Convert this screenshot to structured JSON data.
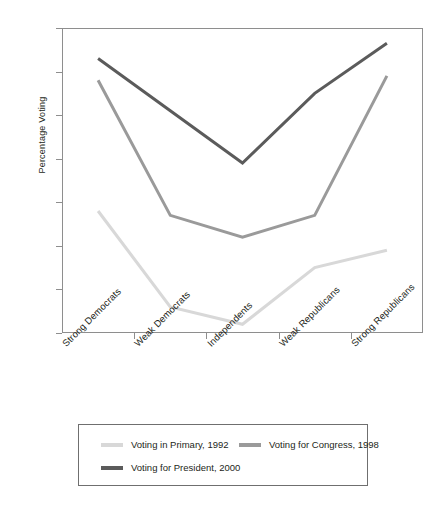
{
  "chart_data": {
    "type": "line",
    "title": "",
    "subtitle": "",
    "xlabel": "",
    "ylabel": "Percentage Voting",
    "categories": [
      "Strong Democrats",
      "Weak Democrats",
      "Independents",
      "Weak Republicans",
      "Strong Republicans"
    ],
    "ylim": [
      20,
      90
    ],
    "yticks": [
      20,
      30,
      40,
      50,
      60,
      70,
      80,
      90
    ],
    "ytick_labels": [
      "20",
      "30",
      "40",
      "50",
      "60",
      "70",
      "80",
      "90"
    ],
    "grid": false,
    "legend_position": "below-axes",
    "series": [
      {
        "name": "Voting in Primary, 1992",
        "color": "#d8d8d8",
        "values": [
          48,
          26,
          22,
          35,
          39
        ]
      },
      {
        "name": "Voting for Congress, 1998",
        "color": "#9a9a9a",
        "values": [
          78,
          47,
          42,
          47,
          79
        ]
      },
      {
        "name": "Voting for President, 2000",
        "color": "#5b5b5b",
        "values": [
          83,
          71,
          59,
          75,
          86.5
        ]
      }
    ]
  },
  "axes": {
    "y_title": "Percentage Voting",
    "frame_color": "#8e8e8e"
  },
  "legend": {
    "entries": [
      {
        "label": "Voting in Primary, 1992",
        "color": "#d8d8d8"
      },
      {
        "label": "Voting for Congress, 1998",
        "color": "#9a9a9a"
      },
      {
        "label": "Voting for President, 2000",
        "color": "#5b5b5b"
      }
    ]
  }
}
